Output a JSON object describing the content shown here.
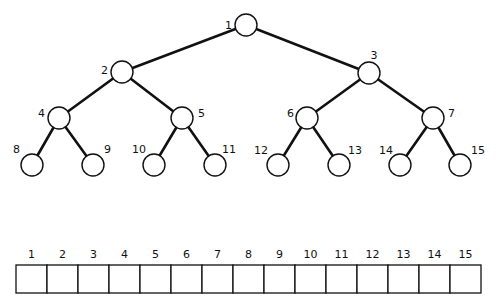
{
  "tree": {
    "type": "complete-binary-tree",
    "nodes": [
      {
        "id": 1,
        "label": "1",
        "cx": 246,
        "cy": 25,
        "lx": 232,
        "ly": 26,
        "anchor": "end"
      },
      {
        "id": 2,
        "label": "2",
        "cx": 122,
        "cy": 72,
        "lx": 108,
        "ly": 71,
        "anchor": "end"
      },
      {
        "id": 3,
        "label": "3",
        "cx": 369,
        "cy": 73,
        "lx": 374,
        "ly": 56,
        "anchor": "middle"
      },
      {
        "id": 4,
        "label": "4",
        "cx": 59,
        "cy": 118,
        "lx": 45,
        "ly": 114,
        "anchor": "end"
      },
      {
        "id": 5,
        "label": "5",
        "cx": 182,
        "cy": 118,
        "lx": 198,
        "ly": 114,
        "anchor": "start"
      },
      {
        "id": 6,
        "label": "6",
        "cx": 307,
        "cy": 118,
        "lx": 294,
        "ly": 114,
        "anchor": "end"
      },
      {
        "id": 7,
        "label": "7",
        "cx": 433,
        "cy": 118,
        "lx": 448,
        "ly": 114,
        "anchor": "start"
      },
      {
        "id": 8,
        "label": "8",
        "cx": 32,
        "cy": 165,
        "lx": 20,
        "ly": 150,
        "anchor": "end"
      },
      {
        "id": 9,
        "label": "9",
        "cx": 93,
        "cy": 165,
        "lx": 104,
        "ly": 150,
        "anchor": "start"
      },
      {
        "id": 10,
        "label": "10",
        "cx": 154,
        "cy": 165,
        "lx": 146,
        "ly": 150,
        "anchor": "end"
      },
      {
        "id": 11,
        "label": "11",
        "cx": 215,
        "cy": 165,
        "lx": 222,
        "ly": 150,
        "anchor": "start"
      },
      {
        "id": 12,
        "label": "12",
        "cx": 278,
        "cy": 165,
        "lx": 268,
        "ly": 151,
        "anchor": "end"
      },
      {
        "id": 13,
        "label": "13",
        "cx": 339,
        "cy": 165,
        "lx": 348,
        "ly": 151,
        "anchor": "start"
      },
      {
        "id": 14,
        "label": "14",
        "cx": 400,
        "cy": 165,
        "lx": 393,
        "ly": 151,
        "anchor": "end"
      },
      {
        "id": 15,
        "label": "15",
        "cx": 460,
        "cy": 165,
        "lx": 471,
        "ly": 151,
        "anchor": "start"
      }
    ],
    "edges": [
      [
        1,
        2
      ],
      [
        1,
        3
      ],
      [
        2,
        4
      ],
      [
        2,
        5
      ],
      [
        3,
        6
      ],
      [
        3,
        7
      ],
      [
        4,
        8
      ],
      [
        4,
        9
      ],
      [
        5,
        10
      ],
      [
        5,
        11
      ],
      [
        6,
        12
      ],
      [
        6,
        13
      ],
      [
        7,
        14
      ],
      [
        7,
        15
      ]
    ],
    "node_radius": 11
  },
  "array": {
    "x": 16,
    "y": 265,
    "height": 28,
    "cell_width": 31,
    "label_y": 258,
    "indices": [
      "1",
      "2",
      "3",
      "4",
      "5",
      "6",
      "7",
      "8",
      "9",
      "10",
      "11",
      "12",
      "13",
      "14",
      "15"
    ],
    "values": [
      "",
      "",
      "",
      "",
      "",
      "",
      "",
      "",
      "",
      "",
      "",
      "",
      "",
      "",
      ""
    ]
  }
}
